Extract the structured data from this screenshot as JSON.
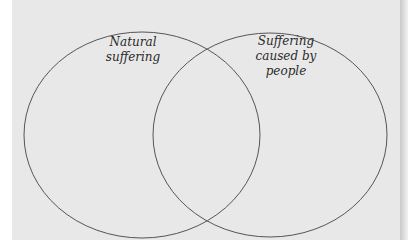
{
  "diagram": {
    "type": "venn",
    "sets": [
      {
        "id": "natural",
        "label_lines": [
          "Natural",
          "suffering"
        ]
      },
      {
        "id": "people",
        "label_lines": [
          "Suffering",
          "caused by",
          "people"
        ]
      }
    ],
    "colors": {
      "background": "#e8e8e8",
      "outline": "#555555",
      "text": "#2a2a2a"
    }
  }
}
